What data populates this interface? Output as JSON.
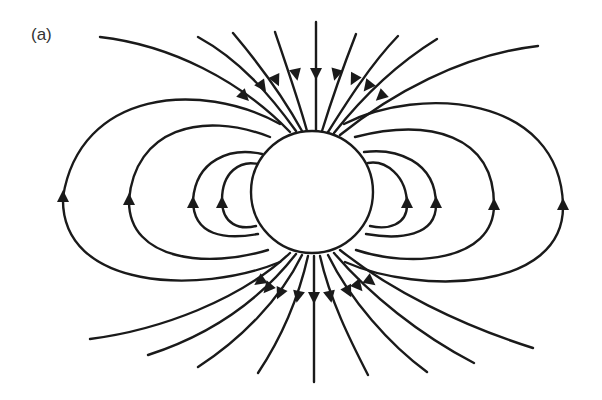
{
  "figure": {
    "panel_label": "(a)",
    "colors": {
      "line": "#1a1a1a",
      "background": "#ffffff"
    },
    "sphere": {
      "cx": 312,
      "cy": 192,
      "r": 61
    },
    "closed_loops": {
      "left_arrow_x": [
        63,
        129,
        193,
        222
      ],
      "right_arrow_x": [
        407,
        436,
        494,
        563
      ],
      "arrow_direction": "up"
    },
    "open_lines": {
      "top_count": 11,
      "bottom_count": 11,
      "top_arrow_direction": "toward sphere",
      "bottom_arrow_direction": "away from sphere"
    }
  }
}
